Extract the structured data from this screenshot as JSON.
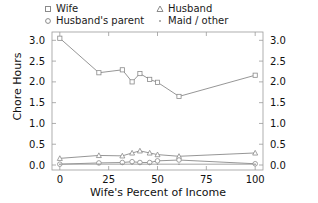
{
  "chart_data": {
    "type": "line",
    "title": "",
    "xlabel": "Wife's Percent of Income",
    "ylabel": "Chore Hours",
    "xlim": [
      -4,
      104
    ],
    "ylim": [
      -0.12,
      3.2
    ],
    "xticks": [
      0,
      25,
      50,
      75,
      100
    ],
    "xtick_labels": [
      "0",
      "25",
      "50",
      "75",
      "100"
    ],
    "yticks": [
      0.0,
      0.5,
      1.0,
      1.5,
      2.0,
      2.5,
      3.0
    ],
    "ytick_labels": [
      "0.0",
      "0.5",
      "1.0",
      "1.5",
      "2.0",
      "2.5",
      "3.0"
    ],
    "right_axis": true,
    "right_ytick_labels": [
      "0.0",
      "0.5",
      "1.0",
      "1.5",
      "2.0",
      "2.5",
      "3.0"
    ],
    "grid": false,
    "legend_position": "above-plot",
    "x": [
      0,
      20,
      32,
      37,
      41,
      46,
      50,
      61,
      100
    ],
    "series": [
      {
        "name": "Wife",
        "marker": "square-open",
        "color": "#8a8a8a",
        "values": [
          3.05,
          2.22,
          2.29,
          2.0,
          2.2,
          2.06,
          1.99,
          1.65,
          2.16
        ]
      },
      {
        "name": "Husband",
        "marker": "triangle-open",
        "color": "#8a8a8a",
        "values": [
          0.16,
          0.23,
          0.22,
          0.29,
          0.34,
          0.29,
          0.25,
          0.21,
          0.29
        ]
      },
      {
        "name": "Husband's parent",
        "marker": "circle-open",
        "color": "#8a8a8a",
        "values": [
          0.02,
          0.05,
          0.06,
          0.08,
          0.06,
          0.06,
          0.1,
          0.12,
          0.03
        ]
      },
      {
        "name": "Maid / other",
        "marker": "dot",
        "color": "#9a9a9a",
        "values": [
          0.02,
          0.02,
          0.02,
          0.02,
          0.02,
          0.02,
          0.02,
          0.02,
          0.02
        ]
      }
    ]
  },
  "legend": {
    "entries": [
      {
        "label": "Wife",
        "marker": "square-open"
      },
      {
        "label": "Husband",
        "marker": "triangle-open"
      },
      {
        "label": "Husband's parent",
        "marker": "circle-open"
      },
      {
        "label": "Maid / other",
        "marker": "dot"
      }
    ]
  },
  "colors": {
    "axis": "#9b9b9b",
    "line": "#8a8a8a",
    "text": "#111111",
    "background": "#ffffff"
  }
}
